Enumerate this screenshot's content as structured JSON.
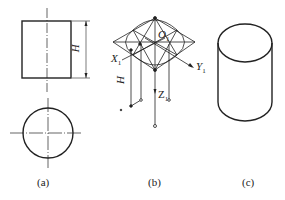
{
  "figure": {
    "panels": [
      {
        "id": "a",
        "caption": "(a)",
        "description": "Orthographic views of cylinder: front rectangle with height H, top circle"
      },
      {
        "id": "b",
        "caption": "(b)",
        "description": "Isometric construction with axes X1, Y1, Z1 and origin O1"
      },
      {
        "id": "c",
        "caption": "(c)",
        "description": "Finished isometric cylinder"
      }
    ],
    "labels": {
      "height_a": "H",
      "height_b": "H",
      "axis_x": "X",
      "axis_x_sub": "1",
      "axis_y": "Y",
      "axis_y_sub": "1",
      "axis_z": "Z",
      "axis_z_sub": "1",
      "origin": "O",
      "origin_sub": "1"
    }
  }
}
